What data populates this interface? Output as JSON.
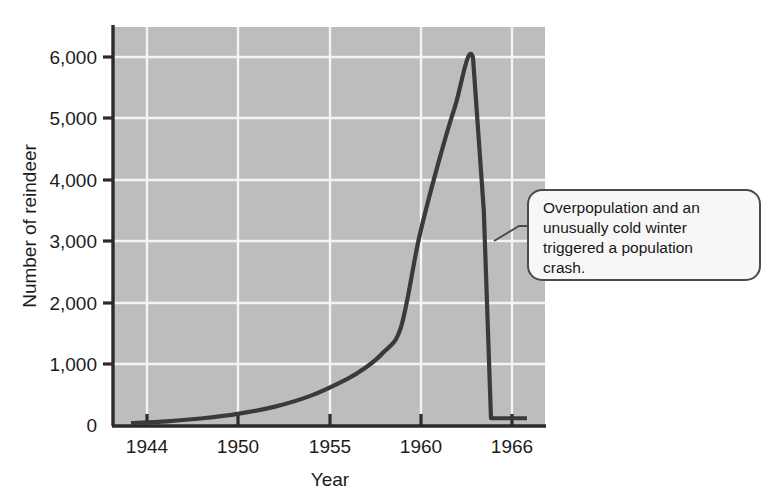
{
  "figure": {
    "background_color": "#ffffff",
    "plot_background_color": "#bdbdbd",
    "gridline_color": "#f2f2f2",
    "axis_color": "#2b2b2b",
    "curve_color": "#3a3a3a",
    "callout_fill": "#f7f7f7",
    "callout_border": "#4a4a4a"
  },
  "chart_data": {
    "type": "line",
    "title": "",
    "xlabel": "Year",
    "ylabel": "Number of reindeer",
    "xlim": [
      1943,
      1967
    ],
    "ylim": [
      0,
      6500
    ],
    "xticks": [
      1944,
      1950,
      1955,
      1960,
      1966
    ],
    "xtick_labels": [
      "1944",
      "1950",
      "1955",
      "1960",
      "1966"
    ],
    "yticks": [
      0,
      1000,
      2000,
      3000,
      4000,
      5000,
      6000
    ],
    "ytick_labels": [
      "0",
      "1,000",
      "2,000",
      "3,000",
      "4,000",
      "5,000",
      "6,000"
    ],
    "grid": true,
    "legend": false,
    "series": [
      {
        "name": "St. Matthew Island reindeer population",
        "x": [
          1944,
          1946,
          1948,
          1950,
          1952,
          1954,
          1956,
          1957,
          1958,
          1959,
          1960,
          1961,
          1962,
          1963,
          1963.6,
          1964,
          1966
        ],
        "values": [
          29,
          60,
          110,
          185,
          300,
          480,
          750,
          930,
          1180,
          1600,
          3050,
          4200,
          5200,
          6000,
          3500,
          110,
          110
        ]
      }
    ],
    "annotations": [
      {
        "text": "Overpopulation and an unusually cold winter triggered a population crash.",
        "lines": [
          "Overpopulation and an",
          "unusually cold winter",
          "triggered a population",
          "crash."
        ],
        "points_to_year": 1964,
        "points_to_value": 2200
      }
    ]
  }
}
